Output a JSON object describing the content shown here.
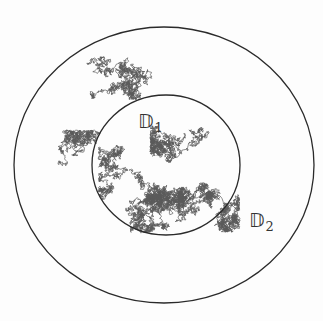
{
  "figure": {
    "width": 323,
    "height": 321,
    "background": "#fdfdfd"
  },
  "disks": {
    "outer": {
      "name": "D2",
      "cx": 164,
      "cy": 165,
      "rx": 150,
      "ry": 138,
      "stroke": "#2a2a2a"
    },
    "inner": {
      "name": "D1",
      "cx": 166,
      "cy": 165,
      "rx": 74,
      "ry": 70,
      "stroke": "#2a2a2a"
    }
  },
  "labels": {
    "inner": {
      "symbol": "𝔻",
      "subscript": "1",
      "x": 138,
      "y": 112
    },
    "outer": {
      "symbol": "𝔻",
      "subscript": "2",
      "x": 249,
      "y": 211
    }
  },
  "path": {
    "color": "#5a5a5a",
    "stroke_width": 0.7,
    "segments": [
      {
        "seed": 11,
        "start": [
          40,
          75
        ],
        "steps": 2600,
        "step": 2.2,
        "bias": [
          0.0,
          0.0
        ],
        "box": [
          18,
          28,
          120,
          170
        ]
      },
      {
        "seed": 23,
        "start": [
          90,
          60
        ],
        "steps": 1400,
        "step": 2.0,
        "bias": [
          0.0,
          0.0
        ],
        "box": [
          60,
          30,
          185,
          100
        ]
      },
      {
        "seed": 37,
        "start": [
          60,
          150
        ],
        "steps": 900,
        "step": 2.0,
        "bias": [
          0.0,
          0.0
        ],
        "box": [
          50,
          130,
          120,
          215
        ]
      },
      {
        "seed": 51,
        "start": [
          130,
          170
        ],
        "steps": 2400,
        "step": 2.0,
        "bias": [
          0.0,
          0.0
        ],
        "box": [
          100,
          140,
          240,
          232
        ]
      },
      {
        "seed": 67,
        "start": [
          160,
          205
        ],
        "steps": 3200,
        "step": 1.8,
        "bias": [
          0.0,
          0.0
        ],
        "box": [
          115,
          185,
          225,
          233
        ]
      },
      {
        "seed": 79,
        "start": [
          200,
          130
        ],
        "steps": 1400,
        "step": 1.9,
        "bias": [
          0.0,
          0.0
        ],
        "box": [
          150,
          100,
          236,
          190
        ]
      },
      {
        "seed": 91,
        "start": [
          110,
          160
        ],
        "steps": 900,
        "step": 1.9,
        "bias": [
          0.0,
          0.0
        ],
        "box": [
          98,
          140,
          170,
          200
        ]
      }
    ]
  }
}
